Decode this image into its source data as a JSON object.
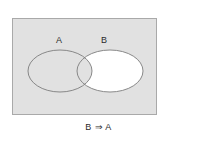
{
  "figure": {
    "type": "venn-diagram",
    "caption": "B ⇒ A",
    "background_color": "#ffffff",
    "universe": {
      "name": "universal-set-rectangle",
      "fill_color": "#e1e1e1",
      "stroke_color": "#a9a9a9",
      "x": 12,
      "y": 18,
      "width": 145,
      "height": 97
    },
    "sets": [
      {
        "label": "A",
        "shape": "ellipse",
        "cx": 60,
        "cy": 71,
        "rx": 32,
        "ry": 21,
        "fill_color": "#e1e1e1",
        "stroke_color": "#7d7d7d",
        "label_x": 56,
        "label_y": 36
      },
      {
        "label": "B",
        "shape": "ellipse",
        "cx": 110,
        "cy": 71,
        "rx": 33,
        "ry": 21,
        "fill_color": "#ffffff",
        "stroke_color": "#7d7d7d",
        "label_x": 101,
        "label_y": 36
      }
    ],
    "regions": [
      {
        "name": "B-only",
        "fill_color": "#ffffff"
      },
      {
        "name": "A-intersect-B",
        "fill_color": "#e1e1e1"
      },
      {
        "name": "A-only",
        "fill_color": "#e1e1e1"
      },
      {
        "name": "outside-both",
        "fill_color": "#e1e1e1"
      }
    ]
  }
}
